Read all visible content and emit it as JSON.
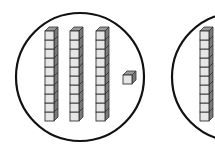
{
  "diagram": {
    "type": "base-ten-blocks",
    "colors": {
      "background": "#ffffff",
      "outline": "#111111",
      "cube_face": "#e6e6e6",
      "cube_top": "#9a9a9a",
      "cube_side": "#7a7a7a",
      "cube_edge": "#333333"
    },
    "groups": [
      {
        "id": "group-1",
        "circle": {
          "cx": 80,
          "cy": 77,
          "r": 64
        },
        "tens_rods": [
          {
            "x": 45,
            "y": 31,
            "cubes": 10
          },
          {
            "x": 70,
            "y": 31,
            "cubes": 10
          },
          {
            "x": 96,
            "y": 31,
            "cubes": 10
          }
        ],
        "unit_cubes": [
          {
            "x": 123,
            "y": 75
          }
        ],
        "value": 31
      },
      {
        "id": "group-2",
        "circle": {
          "cx": 236,
          "cy": 77,
          "r": 64
        },
        "tens_rods": [
          {
            "x": 200,
            "y": 31,
            "cubes": 10
          }
        ],
        "unit_cubes": [],
        "partially_visible": true
      }
    ],
    "cube_size": 9,
    "depth": 4
  }
}
